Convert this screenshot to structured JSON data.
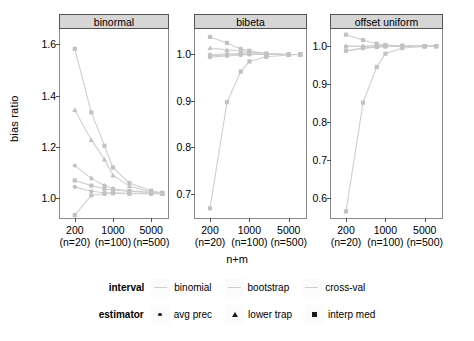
{
  "chart_data": {
    "type": "line",
    "title": "",
    "xlabel": "n+m",
    "ylabel": "bias ratio",
    "grid": false,
    "legend_position": "bottom",
    "x": [
      200,
      400,
      700,
      1000,
      2000,
      5000,
      8000
    ],
    "x_ticks": [
      {
        "value": 200,
        "label": "200",
        "sublabel": "(n=20)"
      },
      {
        "value": 1000,
        "label": "1000",
        "sublabel": "(n=100)"
      },
      {
        "value": 5000,
        "label": "5000",
        "sublabel": "(n=500)"
      }
    ],
    "marker_legend": [
      {
        "name": "avg prec",
        "marker": "circle"
      },
      {
        "name": "lower trap",
        "marker": "triangle"
      },
      {
        "name": "interp med",
        "marker": "square"
      }
    ],
    "interval_legend": [
      "binomial",
      "bootstrap",
      "cross-val"
    ],
    "facets": [
      {
        "name": "binormal",
        "ylim": [
          0.92,
          1.66
        ],
        "y_ticks": [
          1.0,
          1.2,
          1.4,
          1.6
        ],
        "series": [
          {
            "name": "binomial avg prec",
            "marker": "square",
            "values": [
              1.583,
              1.335,
              1.205,
              1.12,
              1.06,
              1.03,
              1.022
            ]
          },
          {
            "name": "bootstrap lower trap",
            "marker": "triangle",
            "values": [
              1.345,
              1.228,
              1.152,
              1.09,
              1.048,
              1.025,
              1.02
            ]
          },
          {
            "name": "cross-val avg prec",
            "marker": "circle",
            "values": [
              1.128,
              1.078,
              1.05,
              1.038,
              1.03,
              1.024,
              1.021
            ]
          },
          {
            "name": "binomial interp med",
            "marker": "square",
            "values": [
              1.07,
              1.05,
              1.038,
              1.032,
              1.028,
              1.022,
              1.02
            ]
          },
          {
            "name": "bootstrap avg prec",
            "marker": "circle",
            "values": [
              1.045,
              1.028,
              1.022,
              1.022,
              1.02,
              1.018,
              1.018
            ]
          },
          {
            "name": "cross-val interp med",
            "marker": "square",
            "values": [
              0.935,
              1.012,
              1.018,
              1.02,
              1.018,
              1.018,
              1.018
            ]
          }
        ]
      },
      {
        "name": "bibeta",
        "ylim": [
          0.645,
          1.055
        ],
        "y_ticks": [
          0.7,
          0.8,
          0.9,
          1.0
        ],
        "series": [
          {
            "name": "binomial avg prec",
            "marker": "square",
            "values": [
              1.038,
              1.025,
              1.012,
              1.008,
              1.002,
              1.0,
              1.0
            ]
          },
          {
            "name": "bootstrap lower trap",
            "marker": "triangle",
            "values": [
              1.014,
              1.01,
              1.008,
              1.006,
              1.002,
              1.0,
              1.0
            ]
          },
          {
            "name": "cross-val avg prec",
            "marker": "circle",
            "values": [
              1.0,
              1.001,
              1.002,
              1.004,
              1.001,
              1.0,
              1.0
            ]
          },
          {
            "name": "binomial interp med",
            "marker": "square",
            "values": [
              0.997,
              0.999,
              1.0,
              1.001,
              1.0,
              1.0,
              1.0
            ]
          },
          {
            "name": "bootstrap avg prec",
            "marker": "circle",
            "values": [
              0.994,
              0.997,
              0.999,
              1.0,
              1.0,
              1.0,
              1.0
            ]
          },
          {
            "name": "cross-val interp med",
            "marker": "square",
            "values": [
              0.668,
              0.897,
              0.963,
              0.985,
              0.995,
              0.999,
              1.0
            ]
          }
        ]
      },
      {
        "name": "offset uniform",
        "ylim": [
          0.545,
          1.045
        ],
        "y_ticks": [
          0.6,
          0.7,
          0.8,
          0.9,
          1.0
        ],
        "series": [
          {
            "name": "binomial avg prec",
            "marker": "square",
            "values": [
              1.03,
              1.016,
              1.006,
              1.003,
              1.001,
              1.0,
              1.0
            ]
          },
          {
            "name": "bootstrap lower trap",
            "marker": "triangle",
            "values": [
              1.0,
              1.0,
              1.001,
              1.002,
              1.001,
              1.0,
              1.0
            ]
          },
          {
            "name": "cross-val avg prec",
            "marker": "circle",
            "values": [
              0.999,
              0.999,
              1.0,
              1.0,
              1.0,
              1.0,
              1.0
            ]
          },
          {
            "name": "binomial interp med",
            "marker": "square",
            "values": [
              0.988,
              0.995,
              0.998,
              0.999,
              1.0,
              1.0,
              1.0
            ]
          },
          {
            "name": "bootstrap avg prec",
            "marker": "circle",
            "values": [
              0.987,
              0.994,
              0.997,
              0.999,
              1.0,
              1.0,
              1.0
            ]
          },
          {
            "name": "cross-val interp med",
            "marker": "square",
            "values": [
              0.565,
              0.851,
              0.945,
              0.98,
              0.995,
              0.999,
              1.0
            ]
          }
        ]
      }
    ]
  },
  "legend": {
    "interval_title": "interval",
    "estimator_title": "estimator"
  },
  "colors": {
    "line": "#cfcfcf",
    "marker": "#c2c2c2",
    "strip_bg": "#d6d6d6",
    "panel_border": "#8a8a8a",
    "text": "#000000"
  }
}
